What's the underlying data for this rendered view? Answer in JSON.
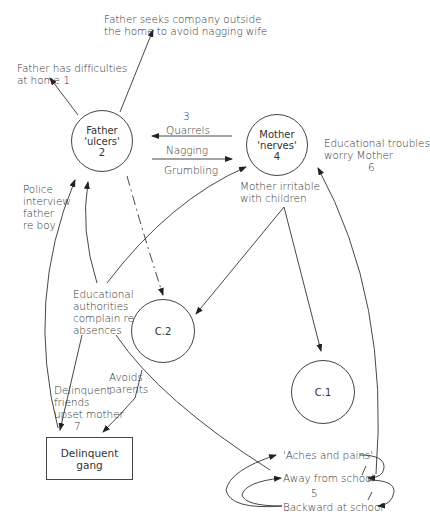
{
  "diagram": {
    "title": "",
    "nodes": {
      "father": {
        "line1": "Father",
        "line2": "'ulcers'",
        "number": "2"
      },
      "mother": {
        "line1": "Mother",
        "line2": "'nerves'",
        "number": "4"
      },
      "c2": {
        "label": "C.2"
      },
      "c1": {
        "label": "C.1"
      },
      "gang": {
        "line1": "Delinquent",
        "line2": "gang"
      }
    },
    "labels": {
      "father_difficulties": {
        "line1": "Father has difficulties",
        "line2": "at home  1"
      },
      "father_seeks": {
        "line1": "Father seeks company outside",
        "line2": "the home to avoid nagging wife"
      },
      "number_3": "3",
      "quarrels": "Quarrels",
      "nagging": "Nagging",
      "grumbling": "Grumbling",
      "educational_troubles": {
        "line1": "Educational troubles",
        "line2": "worry Mother",
        "number": "6"
      },
      "mother_irritable": {
        "line1": "Mother irritable",
        "line2": "with children"
      },
      "police": {
        "line1": "Police",
        "line2": "interview",
        "line3": "father",
        "line4": "re boy"
      },
      "edu_authorities": {
        "line1": "Educational",
        "line2": "authorities",
        "line3": "complain re",
        "line4": "absences"
      },
      "avoids_parents": {
        "line1": "Avoids",
        "line2": "parents"
      },
      "delinquent_friends": {
        "line1": "Delinquent",
        "line2": "friends",
        "line3": "upset  mother",
        "number": "7"
      },
      "aches": "'Aches and pains'",
      "away": "Away  from school",
      "number_5": "5",
      "backward": "Backward  at school"
    }
  }
}
